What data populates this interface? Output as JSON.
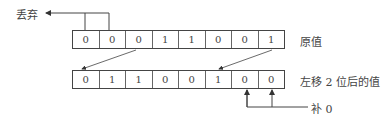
{
  "diagram": {
    "discard_label": "丢弃",
    "original_label": "原值",
    "shifted_label": "左移 2 位后的值",
    "pad_label": "补 0",
    "original_bits": [
      "0",
      "0",
      "0",
      "1",
      "1",
      "0",
      "0",
      "1"
    ],
    "shifted_bits": [
      "0",
      "1",
      "1",
      "0",
      "0",
      "1",
      "0",
      "0"
    ]
  }
}
